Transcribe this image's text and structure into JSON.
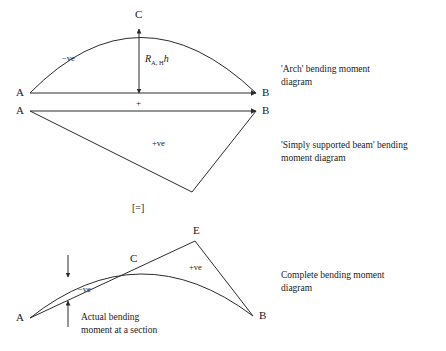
{
  "figure": {
    "title_semantic": "bending-moment-diagram-superposition",
    "stroke_color": "#2b2b2b",
    "text_color": "#1a1a1a",
    "background_color": "#ffffff"
  },
  "equals_symbol": {
    "text": "[=]",
    "x": 140,
    "y": 211
  },
  "diagram_arch": {
    "caption_line1": "'Arch' bending moment",
    "caption_line2": "diagram",
    "caption_x": 281,
    "caption_y1": 72,
    "caption_y2": 85,
    "baseline": {
      "x1": 30,
      "y1": 93,
      "x2": 256,
      "y2": 93
    },
    "arch_path": "M 30 93 Q 139 -18 256 93",
    "label_a": {
      "text": "A",
      "x": 16,
      "y": 96
    },
    "label_b": {
      "text": "B",
      "x": 262,
      "y": 96
    },
    "label_c": {
      "text": "C",
      "x": 135,
      "y": 18
    },
    "sign_negative": {
      "text": "−ve",
      "x": 62,
      "y": 61
    },
    "plus_marker": {
      "text": "+",
      "x": 136,
      "y": 106
    },
    "dimension": {
      "symbol": "R",
      "subscript": "A, H",
      "multiplier": "h",
      "x": 145,
      "y": 62,
      "arrow_x": 139,
      "arrow_top_y": 29,
      "arrow_bottom_y": 93
    }
  },
  "diagram_beam": {
    "caption_line1": "'Simply supported beam' bending",
    "caption_line2": "moment diagram",
    "caption_x": 281,
    "caption_y1": 148,
    "caption_y2": 161,
    "top_chord": {
      "x1": 30,
      "y1": 111,
      "x2": 256,
      "y2": 111
    },
    "left_edge": {
      "x1": 30,
      "y1": 111,
      "x2": 192,
      "y2": 192
    },
    "right_edge": {
      "x1": 192,
      "y1": 192,
      "x2": 256,
      "y2": 111
    },
    "label_a": {
      "text": "A",
      "x": 16,
      "y": 114
    },
    "label_b": {
      "text": "B",
      "x": 262,
      "y": 114
    },
    "sign_positive": {
      "text": "+ve",
      "x": 152,
      "y": 146
    }
  },
  "diagram_complete": {
    "caption_line1": "Complete bending moment",
    "caption_line2": "diagram",
    "caption_x": 281,
    "caption_y1": 278,
    "caption_y2": 291,
    "arch_path": "M 30 318 Q 140 231 253 316",
    "left_edge": {
      "x1": 30,
      "y1": 318,
      "x2": 195,
      "y2": 241
    },
    "right_edge": {
      "x1": 195,
      "y1": 241,
      "x2": 253,
      "y2": 316
    },
    "label_a": {
      "text": "A",
      "x": 16,
      "y": 321
    },
    "label_b": {
      "text": "B",
      "x": 259,
      "y": 319
    },
    "label_c": {
      "text": "C",
      "x": 130,
      "y": 262
    },
    "label_e": {
      "text": "E",
      "x": 193,
      "y": 234
    },
    "sign_negative": {
      "text": "−ve",
      "x": 78,
      "y": 292
    },
    "sign_positive": {
      "text": "+ve",
      "x": 189,
      "y": 270
    },
    "annotation_line1": "Actual bending",
    "annotation_line2": "moment at a section",
    "annotation_x": 81,
    "annotation_y1": 320,
    "annotation_y2": 333,
    "section_arrows": {
      "x": 68,
      "down_start_y": 255,
      "down_end_y": 277,
      "up_start_y": 327,
      "up_end_y": 301
    }
  }
}
